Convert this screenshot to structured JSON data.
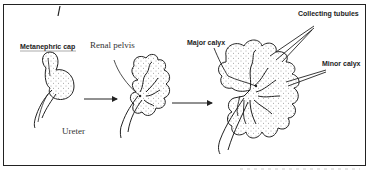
{
  "diagram": {
    "type": "biology-illustration",
    "stages": [
      {
        "id": "stage-1",
        "labels": [
          "Metanephric cap",
          "Ureter"
        ]
      },
      {
        "id": "stage-2",
        "labels": [
          "Renal pelvis"
        ]
      },
      {
        "id": "stage-3",
        "labels": [
          "Major calyx",
          "Collecting tubules",
          "Minor calyx"
        ]
      }
    ],
    "labels": {
      "metanephric_cap": "Metanephric cap",
      "renal_pelvis": "Renal pelvis",
      "ureter": "Ureter",
      "major_calyx": "Major calyx",
      "collecting_tubules": "Collecting tubules",
      "minor_calyx": "Minor calyx"
    },
    "arrows": [
      {
        "from": "stage-1",
        "to": "stage-2"
      },
      {
        "from": "stage-2",
        "to": "stage-3"
      }
    ],
    "colors": {
      "stroke": "#222222",
      "stipple": "#555555",
      "background": "#ffffff"
    }
  }
}
